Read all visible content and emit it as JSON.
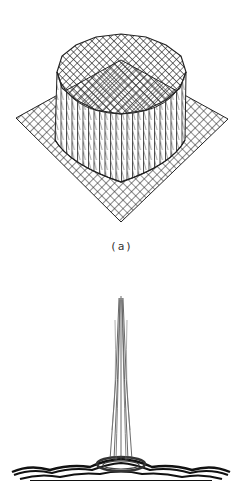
{
  "figures": [
    {
      "id": "a",
      "caption": "(a)",
      "description": "3D wireframe surface of a cylindrical (circular top-hat) function over a square grid base",
      "colors": {
        "line": "#222222",
        "background": "#ffffff"
      }
    },
    {
      "id": "b",
      "caption": "",
      "description": "3D wireframe surface of an Airy-like pattern: tall narrow central peak with low ring ripples at the base",
      "colors": {
        "line": "#333333",
        "background": "#ffffff"
      }
    }
  ]
}
